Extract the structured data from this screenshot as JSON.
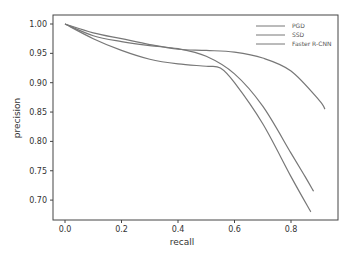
{
  "chart_data": {
    "type": "line",
    "title": "",
    "xlabel": "recall",
    "ylabel": "precision",
    "xlim": [
      -0.04,
      0.96
    ],
    "ylim": [
      0.665,
      1.015
    ],
    "xticks": [
      "0.0",
      "0.2",
      "0.4",
      "0.6",
      "0.8"
    ],
    "yticks": [
      "0.70",
      "0.75",
      "0.80",
      "0.85",
      "0.90",
      "0.95",
      "1.00"
    ],
    "grid": false,
    "legend_position": "upper right",
    "series": [
      {
        "name": "PGD",
        "x": [
          0,
          0.1,
          0.2,
          0.3,
          0.4,
          0.5,
          0.6,
          0.7,
          0.8,
          0.9,
          0.92
        ],
        "y": [
          1.0,
          0.985,
          0.975,
          0.965,
          0.957,
          0.955,
          0.952,
          0.942,
          0.92,
          0.87,
          0.855
        ]
      },
      {
        "name": "SSD",
        "x": [
          0,
          0.1,
          0.2,
          0.3,
          0.4,
          0.5,
          0.6,
          0.7,
          0.8,
          0.85,
          0.88
        ],
        "y": [
          1.0,
          0.98,
          0.97,
          0.963,
          0.958,
          0.945,
          0.915,
          0.86,
          0.78,
          0.74,
          0.715
        ]
      },
      {
        "name": "Faster R-CNN",
        "x": [
          0,
          0.1,
          0.2,
          0.3,
          0.4,
          0.5,
          0.55,
          0.6,
          0.7,
          0.8,
          0.87
        ],
        "y": [
          1.0,
          0.975,
          0.955,
          0.94,
          0.932,
          0.928,
          0.925,
          0.9,
          0.83,
          0.74,
          0.68
        ]
      }
    ]
  }
}
